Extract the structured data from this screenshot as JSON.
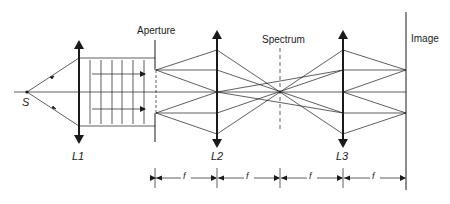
{
  "diagram": {
    "title": "",
    "labels": {
      "source": "S",
      "lens1": "L1",
      "aperture": "Aperture",
      "lens2": "L2",
      "spectrum": "Spectrum",
      "lens3": "L3",
      "image": "Image"
    },
    "focal_length_label": "f",
    "focal_segments": [
      "f",
      "f",
      "f",
      "f"
    ],
    "colors": {
      "line": "#1a1a1a",
      "background": "#ffffff"
    }
  }
}
